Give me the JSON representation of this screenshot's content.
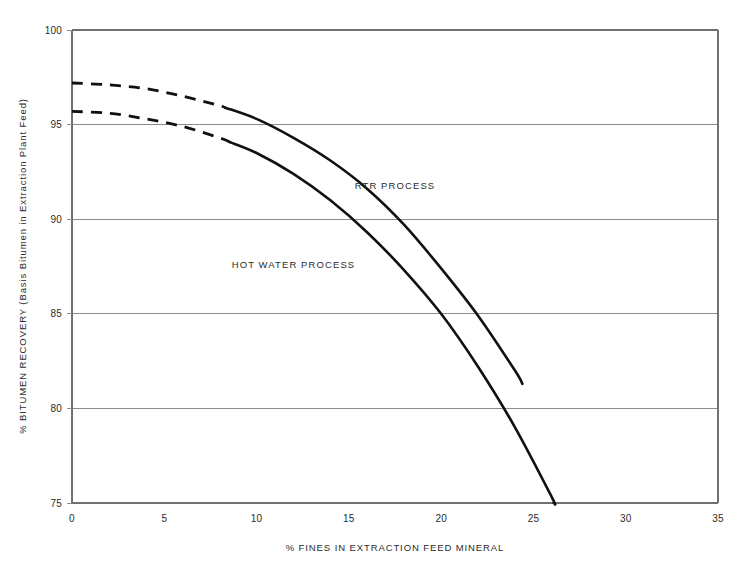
{
  "chart_data": {
    "type": "line",
    "title": "",
    "xlabel": "% FINES IN EXTRACTION FEED MINERAL",
    "ylabel": "% BITUMEN RECOVERY (Basis Bitumen in Extraction Plant Feed)",
    "xlim": [
      0,
      35
    ],
    "ylim": [
      75,
      100
    ],
    "xticks": [
      0,
      5,
      10,
      15,
      20,
      25,
      30,
      35
    ],
    "xtick_labels": [
      "0",
      "5",
      "10",
      "15",
      "20",
      "25",
      "30",
      "35"
    ],
    "yticks": [
      75,
      80,
      85,
      90,
      95,
      100
    ],
    "ytick_labels": [
      "75",
      "80",
      "85",
      "90",
      "95",
      "100"
    ],
    "grid": "horizontal",
    "legend": "inline-annotations",
    "line_color": "#111111",
    "grid_color": "#8c8c8c",
    "series": [
      {
        "name": "RTR PROCESS",
        "label_x": 17.5,
        "label_y": 91.6,
        "dashed_until_x": 8.3,
        "x": [
          0,
          2,
          4,
          6,
          8,
          10,
          12,
          14,
          16,
          18,
          20,
          22,
          24,
          24.4
        ],
        "values": [
          97.2,
          97.1,
          96.9,
          96.5,
          96.0,
          95.3,
          94.3,
          93.1,
          91.6,
          89.7,
          87.4,
          84.9,
          82.0,
          81.3
        ]
      },
      {
        "name": "HOT WATER PROCESS",
        "label_x": 12.0,
        "label_y": 87.4,
        "dashed_until_x": 8.6,
        "x": [
          0,
          2,
          4,
          6,
          8,
          10,
          12,
          14,
          16,
          18,
          20,
          22,
          24,
          26,
          26.1
        ],
        "values": [
          95.7,
          95.6,
          95.3,
          94.9,
          94.3,
          93.5,
          92.4,
          91.0,
          89.3,
          87.3,
          85.0,
          82.2,
          79.0,
          75.3,
          75.0
        ]
      }
    ]
  }
}
